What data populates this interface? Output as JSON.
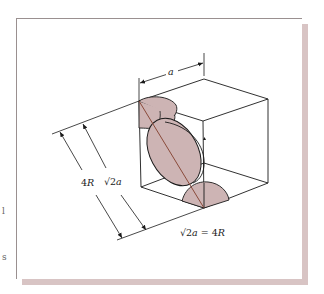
{
  "figure": {
    "labels": {
      "edge_length": "a",
      "outer_dimension": "4R",
      "inner_dimension_prefix": "√2",
      "inner_dimension_var": "a",
      "equation_prefix": "√2",
      "equation_var": "a",
      "equation_rest": " = 4",
      "equation_var2": "R",
      "outer_num": "4",
      "outer_var": "R"
    },
    "colors": {
      "sphere_fill": "#cdb4b4",
      "line": "#1a1a1a",
      "diagonal": "#8a4a3a",
      "frame_shadow": "#d8c4c4"
    }
  },
  "edge_fragments": [
    "l",
    "s"
  ]
}
